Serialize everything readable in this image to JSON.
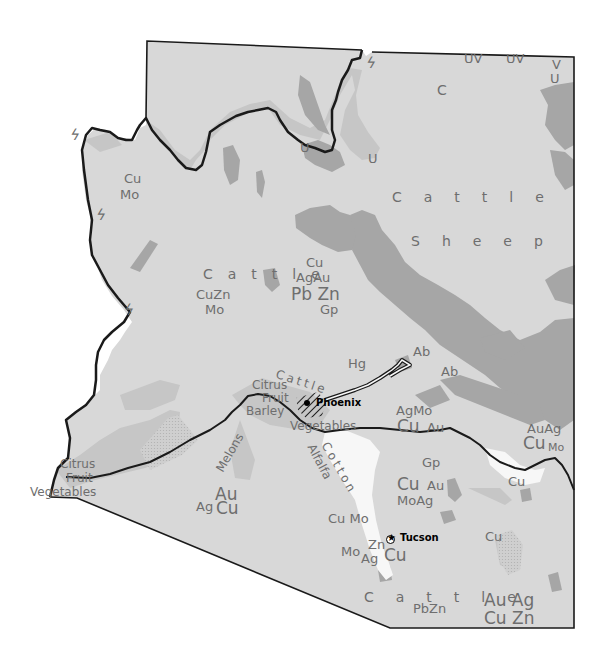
{
  "map": {
    "region": "Arizona",
    "colors": {
      "background": "#ffffff",
      "land": "#d8d8d8",
      "forest_dark": "#a6a6a6",
      "grazing_medium": "#c3c3c3",
      "irrigated": "#f7f7f7",
      "border": "#1a1a1a",
      "label": "#6e6e6e",
      "city_label": "#000000"
    },
    "cities": [
      {
        "name": "Phoenix"
      },
      {
        "name": "Tucson"
      }
    ],
    "land_use_labels": {
      "cattle_north": "Cattle",
      "sheep": "Sheep",
      "cattle_central": "Cattle",
      "cattle_phoenix": "Cattle",
      "cattle_south": "Cattle",
      "c_north": "C",
      "citrus_phoenix": "Citrus",
      "fruit_phoenix": "Fruit",
      "barley": "Barley",
      "vegetables_phoenix": "Vegetables",
      "melons": "Melons",
      "cotton": "Cotton",
      "alfalfa": "Alfalfa",
      "citrus_yuma": "Citrus",
      "fruit_yuma": "Fruit",
      "vegetables_yuma": "Vegetables"
    },
    "mineral_labels": {
      "nw_cu": "Cu",
      "nw_mo": "Mo",
      "w_cuzn": "CuZn",
      "w_mo": "Mo",
      "c_cu": "Cu",
      "c_agau": "AgAu",
      "c_pbzn": "Pb Zn",
      "c_gp": "Gp",
      "hg": "Hg",
      "ab1": "Ab",
      "ab2": "Ab",
      "u1": "U",
      "u2": "U",
      "uv1": "UV",
      "uv2": "UV",
      "v_ne": "V",
      "u_ne": "U",
      "globe_agmo": "AgMo",
      "globe_cu": "Cu",
      "globe_au": "Au",
      "gp_s": "Gp",
      "s_cu": "Cu",
      "s_au": "Au",
      "s_moag": "MoAg",
      "e_auag": "AuAg",
      "e_cu": "Cu",
      "e_mo": "Mo",
      "e_cu2": "Cu",
      "sw_au": "Au",
      "sw_ag": "Ag",
      "sw_cu": "Cu",
      "tuc_cumo": "Cu Mo",
      "tuc_zn": "Zn",
      "tuc_mo": "Mo",
      "tuc_ag": "Ag",
      "tuc_cu": "Cu",
      "se_cu": "Cu",
      "se_pbzn": "PbZn",
      "se_auag": "Au Ag",
      "se_cuzn": "Cu Zn"
    },
    "symbols": {
      "hydro_power": "hydro-power-bolt"
    }
  }
}
